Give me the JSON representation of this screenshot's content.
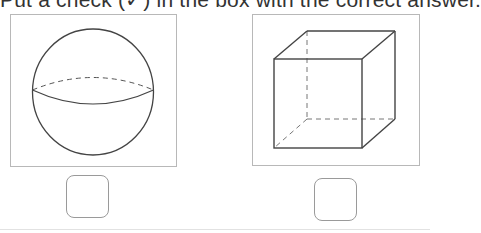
{
  "instruction": {
    "text": "Put a check (✓) in the box with the correct answer."
  },
  "options": [
    {
      "shape": "sphere",
      "checked": false
    },
    {
      "shape": "cube",
      "checked": false
    }
  ],
  "colors": {
    "line": "#444444",
    "frame": "#b8b8b8",
    "box": "#9a9a9a"
  }
}
